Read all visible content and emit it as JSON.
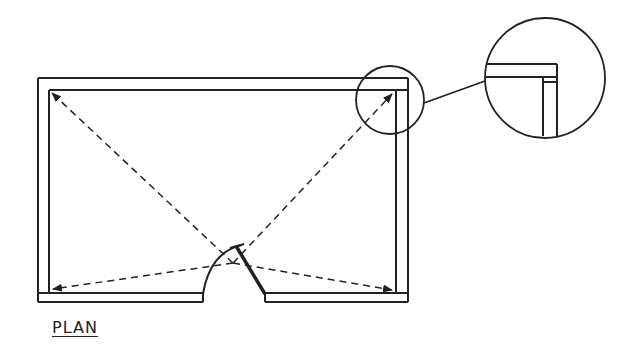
{
  "title": "PLAN",
  "colors": {
    "stroke": "#222222",
    "background": "#ffffff"
  },
  "diagram": {
    "type": "architectural-floor-plan",
    "elements": [
      "room walls (double-line)",
      "door opening with swing arc and door leaf on bottom wall",
      "dashed sight lines with arrows from door to four room corners",
      "detail callout circle at top-right corner",
      "enlarged detail circle showing corner wall junction"
    ]
  }
}
